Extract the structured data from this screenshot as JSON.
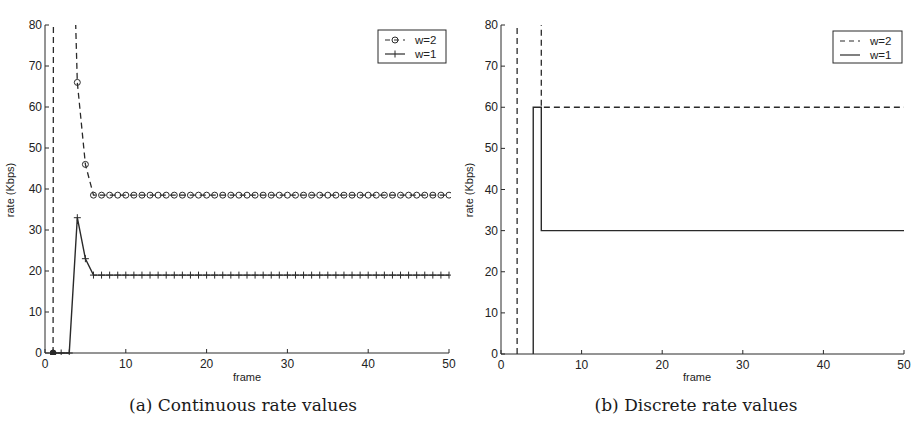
{
  "chart_data": [
    {
      "id": "a",
      "type": "line",
      "caption": "(a) Continuous rate values",
      "xlabel": "frame",
      "ylabel": "rate (Kbps)",
      "xlim": [
        0,
        50
      ],
      "ylim": [
        0,
        80
      ],
      "xticks": [
        0,
        10,
        20,
        30,
        40,
        50
      ],
      "yticks": [
        0,
        10,
        20,
        30,
        40,
        50,
        60,
        70,
        80
      ],
      "grid": false,
      "legend_position": "top-right",
      "series": [
        {
          "name": "w=2",
          "style": "dashed",
          "marker": "circle",
          "x": [
            1,
            2,
            3,
            4,
            5,
            6,
            7,
            8,
            9,
            10,
            11,
            12,
            13,
            14,
            15,
            16,
            17,
            18,
            19,
            20,
            21,
            22,
            23,
            24,
            25,
            26,
            27,
            28,
            29,
            30,
            31,
            32,
            33,
            34,
            35,
            36,
            37,
            38,
            39,
            40,
            41,
            42,
            43,
            44,
            45,
            46,
            47,
            48,
            49,
            50
          ],
          "y": [
            0,
            2000,
            136,
            66,
            46,
            38.5,
            38.5,
            38.5,
            38.5,
            38.5,
            38.5,
            38.5,
            38.5,
            38.5,
            38.5,
            38.5,
            38.5,
            38.5,
            38.5,
            38.5,
            38.5,
            38.5,
            38.5,
            38.5,
            38.5,
            38.5,
            38.5,
            38.5,
            38.5,
            38.5,
            38.5,
            38.5,
            38.5,
            38.5,
            38.5,
            38.5,
            38.5,
            38.5,
            38.5,
            38.5,
            38.5,
            38.5,
            38.5,
            38.5,
            38.5,
            38.5,
            38.5,
            38.5,
            38.5,
            38.5
          ]
        },
        {
          "name": "w=1",
          "style": "solid",
          "marker": "plus",
          "x": [
            1,
            2,
            3,
            4,
            5,
            6,
            7,
            8,
            9,
            10,
            11,
            12,
            13,
            14,
            15,
            16,
            17,
            18,
            19,
            20,
            21,
            22,
            23,
            24,
            25,
            26,
            27,
            28,
            29,
            30,
            31,
            32,
            33,
            34,
            35,
            36,
            37,
            38,
            39,
            40,
            41,
            42,
            43,
            44,
            45,
            46,
            47,
            48,
            49,
            50
          ],
          "y": [
            0,
            0,
            0,
            33,
            23,
            19,
            19,
            19,
            19,
            19,
            19,
            19,
            19,
            19,
            19,
            19,
            19,
            19,
            19,
            19,
            19,
            19,
            19,
            19,
            19,
            19,
            19,
            19,
            19,
            19,
            19,
            19,
            19,
            19,
            19,
            19,
            19,
            19,
            19,
            19,
            19,
            19,
            19,
            19,
            19,
            19,
            19,
            19,
            19,
            19
          ]
        }
      ]
    },
    {
      "id": "b",
      "type": "line",
      "caption": "(b) Discrete rate values",
      "xlabel": "frame",
      "ylabel": "rate (Kbps)",
      "xlim": [
        0,
        50
      ],
      "ylim": [
        0,
        80
      ],
      "xticks": [
        0,
        10,
        20,
        30,
        40,
        50
      ],
      "yticks": [
        0,
        10,
        20,
        30,
        40,
        50,
        60,
        70,
        80
      ],
      "grid": false,
      "legend_position": "top-right",
      "series": [
        {
          "name": "w=2",
          "style": "dashed",
          "marker": "none",
          "x": [
            2,
            2,
            5,
            5,
            50
          ],
          "y": [
            0,
            2000,
            2000,
            60,
            60
          ]
        },
        {
          "name": "w=1",
          "style": "solid",
          "marker": "none",
          "x": [
            4,
            4,
            5,
            5,
            50
          ],
          "y": [
            0,
            60,
            60,
            30,
            30
          ]
        }
      ]
    }
  ]
}
